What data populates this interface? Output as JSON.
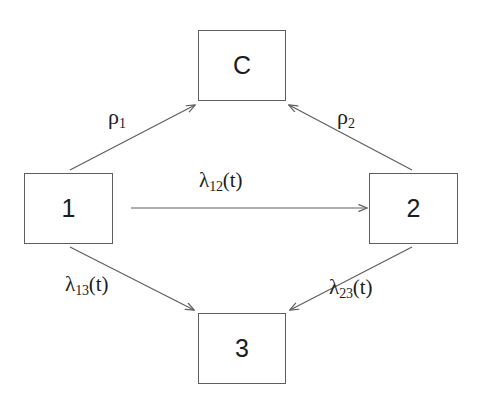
{
  "diagram": {
    "type": "state-transition-diagram",
    "canvas": {
      "width": 478,
      "height": 407
    },
    "colors": {
      "background": "#ffffff",
      "stroke": "#5e5e5e",
      "text": "#1c1c1c"
    },
    "nodes": [
      {
        "id": "C",
        "label": "C",
        "x": 198,
        "y": 30,
        "w": 88,
        "h": 71
      },
      {
        "id": "1",
        "label": "1",
        "x": 24,
        "y": 173,
        "w": 89,
        "h": 71
      },
      {
        "id": "2",
        "label": "2",
        "x": 369,
        "y": 173,
        "w": 89,
        "h": 71
      },
      {
        "id": "3",
        "label": "3",
        "x": 198,
        "y": 313,
        "w": 88,
        "h": 71
      }
    ],
    "edges": [
      {
        "id": "e-1-C",
        "from": "1",
        "to": "C",
        "label_base": "ρ",
        "label_sub": "1",
        "label_tail": "",
        "label_x": 108,
        "label_y": 106,
        "x1": 70,
        "y1": 170,
        "x2": 195,
        "y2": 105
      },
      {
        "id": "e-2-C",
        "from": "2",
        "to": "C",
        "label_base": "ρ",
        "label_sub": "2",
        "label_tail": "",
        "label_x": 337,
        "label_y": 106,
        "x1": 412,
        "y1": 170,
        "x2": 289,
        "y2": 105
      },
      {
        "id": "e-1-2",
        "from": "1",
        "to": "2",
        "label_base": "λ",
        "label_sub": "12",
        "label_tail": "(t)",
        "label_x": 199,
        "label_y": 170,
        "x1": 131,
        "y1": 208,
        "x2": 367,
        "y2": 208
      },
      {
        "id": "e-1-3",
        "from": "1",
        "to": "3",
        "label_base": "λ",
        "label_sub": "13",
        "label_tail": "(t)",
        "label_x": 65,
        "label_y": 274,
        "x1": 70,
        "y1": 247,
        "x2": 194,
        "y2": 310
      },
      {
        "id": "e-2-3",
        "from": "2",
        "to": "3",
        "label_base": "λ",
        "label_sub": "23",
        "label_tail": "(t)",
        "label_x": 329,
        "label_y": 277,
        "x1": 412,
        "y1": 247,
        "x2": 290,
        "y2": 310
      }
    ]
  }
}
